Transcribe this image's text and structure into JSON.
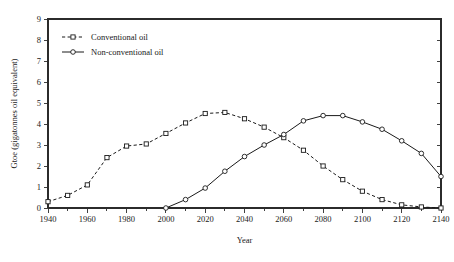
{
  "chart_data": {
    "type": "line",
    "title": "",
    "xlabel": "Year",
    "ylabel": "Gtoe (gigatonnes oil equivalent)",
    "xlim": [
      1940,
      2140
    ],
    "ylim": [
      0,
      9
    ],
    "xticks": [
      1940,
      1960,
      1980,
      2000,
      2020,
      2040,
      2060,
      2080,
      2100,
      2120,
      2140
    ],
    "xtick_labels": [
      "1940",
      "1960",
      "1980",
      "2000",
      "2020",
      "2040",
      "2060",
      "2080",
      "2100",
      "2120",
      "2140"
    ],
    "xminor_step": 10,
    "yticks": [
      0,
      1,
      2,
      3,
      4,
      5,
      6,
      7,
      8,
      9
    ],
    "ytick_labels": [
      "0",
      "1",
      "2",
      "3",
      "4",
      "5",
      "6",
      "7",
      "8",
      "9"
    ],
    "grid": false,
    "legend_position": "top-left",
    "frame": "box",
    "series": [
      {
        "name": "Conventional oil",
        "style": "dashed",
        "marker": "square",
        "color": "#1a1a1a",
        "x": [
          1940,
          1950,
          1960,
          1970,
          1980,
          1990,
          2000,
          2010,
          2020,
          2030,
          2040,
          2050,
          2060,
          2070,
          2080,
          2090,
          2100,
          2110,
          2120,
          2130,
          2140
        ],
        "values": [
          0.3,
          0.6,
          1.1,
          2.4,
          2.95,
          3.05,
          3.55,
          4.05,
          4.5,
          4.55,
          4.25,
          3.85,
          3.35,
          2.75,
          2.0,
          1.35,
          0.8,
          0.4,
          0.15,
          0.05,
          0.0
        ]
      },
      {
        "name": "Non-conventional oil",
        "style": "solid",
        "marker": "circle",
        "color": "#1a1a1a",
        "x": [
          2000,
          2010,
          2020,
          2030,
          2040,
          2050,
          2060,
          2070,
          2080,
          2090,
          2100,
          2110,
          2120,
          2130,
          2140
        ],
        "values": [
          0.0,
          0.4,
          0.95,
          1.75,
          2.45,
          3.0,
          3.5,
          4.15,
          4.4,
          4.4,
          4.1,
          3.75,
          3.2,
          2.6,
          1.5
        ]
      }
    ]
  },
  "legend": {
    "entries": [
      {
        "label": "Conventional oil"
      },
      {
        "label": "Non-conventional oil"
      }
    ]
  }
}
